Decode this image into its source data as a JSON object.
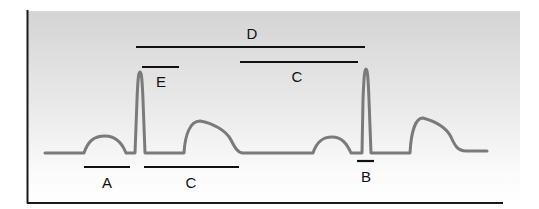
{
  "diagram": {
    "type": "ECG waveform with interval annotations",
    "colors": {
      "panel_top": "#d6d6d6",
      "panel_bottom": "#ffffff",
      "trace": "#7a7a7a",
      "annotation": "#111111",
      "frame": "#1a1a1a"
    },
    "labels": {
      "A": "A",
      "B": "B",
      "C_lower": "C",
      "C_upper": "C",
      "D": "D",
      "E": "E"
    },
    "annotations": [
      {
        "id": "A",
        "label": "A",
        "x1": 84,
        "x2": 130,
        "y": 167,
        "label_y": 187
      },
      {
        "id": "C_lower",
        "label": "C",
        "x1": 144,
        "x2": 239,
        "y": 167,
        "label_y": 187
      },
      {
        "id": "B",
        "label": "B",
        "x1": 357,
        "x2": 374,
        "y": 161,
        "label_y": 182
      },
      {
        "id": "E",
        "label": "E",
        "x1": 142,
        "x2": 179,
        "y": 67,
        "label_y": 86
      },
      {
        "id": "C_upper",
        "label": "C",
        "x1": 240,
        "x2": 358,
        "y": 62,
        "label_y": 82
      },
      {
        "id": "D",
        "label": "D",
        "x1": 136,
        "x2": 365,
        "y": 47,
        "label_y": 38
      }
    ]
  }
}
